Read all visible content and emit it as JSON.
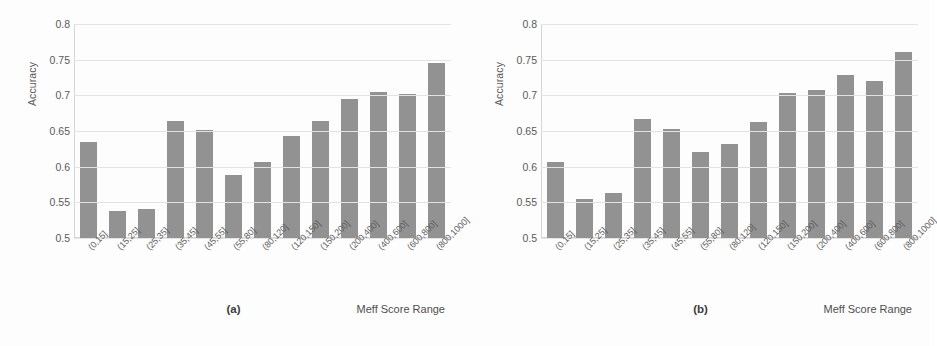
{
  "figure": {
    "width": 935,
    "height": 346,
    "background": "#fdfdfd",
    "bar_color": "#929292",
    "grid_color": "#e3e3e3",
    "text_color": "#5a5a5a"
  },
  "chart_data": [
    {
      "type": "bar",
      "title": "",
      "caption": "(a)",
      "xlabel": "Meff Score Range",
      "ylabel": "Accuracy",
      "ylim": [
        0.5,
        0.8
      ],
      "yticks": [
        0.5,
        0.55,
        0.6,
        0.65,
        0.7,
        0.75,
        0.8
      ],
      "ytick_labels": [
        "0.5",
        "0.55",
        "0.6",
        "0.65",
        "0.7",
        "0.75",
        "0.8"
      ],
      "grid": true,
      "legend": "none",
      "categories": [
        "(0,15]",
        "(15,25]",
        "(25,35]",
        "(35,45]",
        "(45,55]",
        "(55,80]",
        "(80,120]",
        "(120,150]",
        "(150,200]",
        "(200,400]",
        "(400,600]",
        "(600,800]",
        "(800,1000]"
      ],
      "values": [
        0.634,
        0.538,
        0.54,
        0.664,
        0.652,
        0.588,
        0.606,
        0.643,
        0.664,
        0.695,
        0.705,
        0.702,
        0.745
      ]
    },
    {
      "type": "bar",
      "title": "",
      "caption": "(b)",
      "xlabel": "Meff Score Range",
      "ylabel": "Accuracy",
      "ylim": [
        0.5,
        0.8
      ],
      "yticks": [
        0.5,
        0.55,
        0.6,
        0.65,
        0.7,
        0.75,
        0.8
      ],
      "ytick_labels": [
        "0.5",
        "0.55",
        "0.6",
        "0.65",
        "0.7",
        "0.75",
        "0.8"
      ],
      "grid": true,
      "legend": "none",
      "categories": [
        "(0,15]",
        "(15,25]",
        "(25,35]",
        "(35,45]",
        "(45,55]",
        "(55,80]",
        "(80,120]",
        "(120,150]",
        "(150,200]",
        "(200,400]",
        "(400,600]",
        "(600,800]",
        "(800,1000]"
      ],
      "values": [
        0.607,
        0.554,
        0.563,
        0.667,
        0.653,
        0.62,
        0.632,
        0.663,
        0.703,
        0.707,
        0.729,
        0.72,
        0.761
      ]
    }
  ]
}
